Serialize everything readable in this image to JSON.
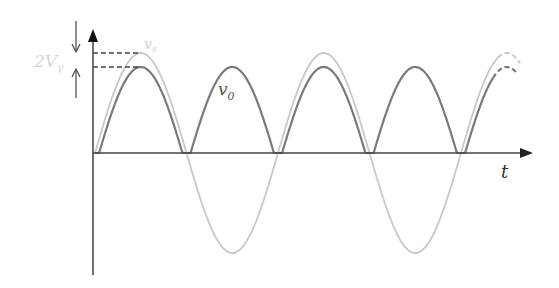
{
  "labels": {
    "drop_label": "2V",
    "drop_subscript": "γ",
    "vs_label": "v",
    "vs_subscript": "s",
    "vo_label": "v",
    "vo_subscript": "0",
    "time_axis_label": "t"
  },
  "waveforms": {
    "description": "Full-wave rectifier: source sinusoid v_s and rectified output v_o reduced by 2V_γ",
    "vs_half_cycles_shown": 5,
    "vo_pulses_shown": 5,
    "last_pulse_dashed": true
  },
  "colors": {
    "axis": "#333333",
    "vs": "#c8c8c8",
    "vo": "#7a7a7a",
    "label_light": "#cfcfcf",
    "label_dark": "#555555"
  }
}
